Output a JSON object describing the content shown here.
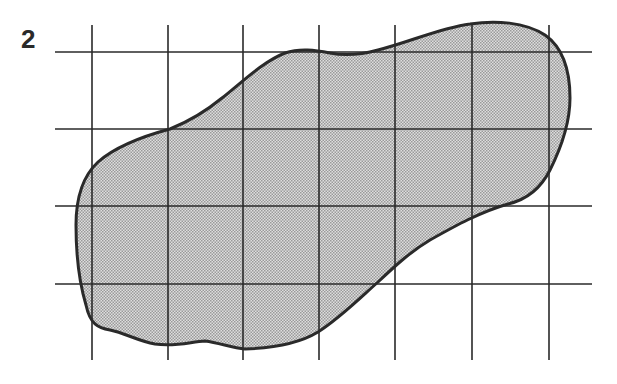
{
  "figure": {
    "label": "2",
    "grid": {
      "vertical_lines_x": [
        92,
        168,
        243,
        319,
        395,
        472,
        549
      ],
      "vertical_extent_y": [
        25,
        360
      ],
      "horizontal_lines_y": [
        52,
        129,
        206,
        284
      ],
      "horizontal_extent_x": [
        55,
        592
      ],
      "line_color": "#2a2a2a",
      "line_width": 1.6
    },
    "shape": {
      "fill_color": "#c8c8c8",
      "stroke_color": "#2a2a2a",
      "stroke_width": 3,
      "path": "M170,129 C185,123 205,112 222,98 C240,84 262,62 285,53 C300,48 315,50 330,53 C345,56 360,55 378,50 C410,42 440,28 470,24 C495,20 525,22 545,35 C562,47 570,70 570,98 C570,125 560,150 550,170 C540,190 525,200 508,204 C480,212 455,226 430,240 C410,252 395,266 378,282 C360,298 340,318 318,332 C300,343 275,348 245,349 C232,348 220,343 205,341 C190,342 175,347 155,344 C138,341 125,333 110,330 C98,328 90,324 86,305 C80,285 76,260 76,225 C76,195 84,175 98,162 C115,147 140,137 170,129 Z"
    },
    "pattern": {
      "dot_color": "#9a9a9a",
      "background": "#dedede"
    }
  }
}
